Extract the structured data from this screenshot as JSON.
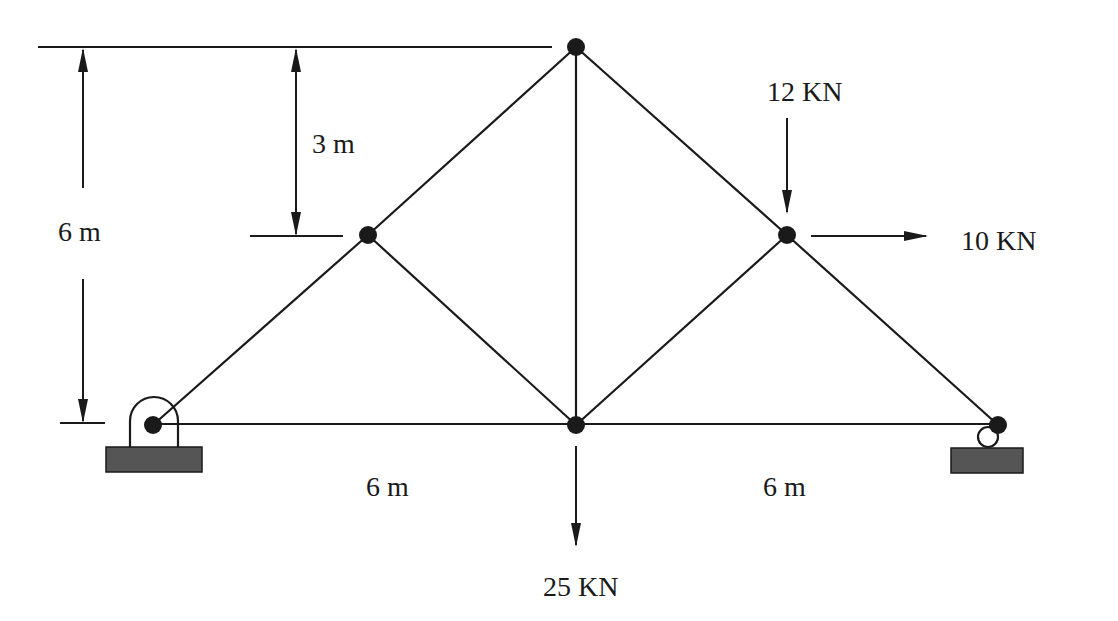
{
  "diagram": {
    "nodes": [
      {
        "id": "A",
        "role": "pin-support",
        "x": 153,
        "y": 425
      },
      {
        "id": "B",
        "role": "joint",
        "x": 368,
        "y": 235
      },
      {
        "id": "C",
        "role": "apex",
        "x": 576,
        "y": 47
      },
      {
        "id": "D",
        "role": "bottom-mid",
        "x": 576,
        "y": 425
      },
      {
        "id": "E",
        "role": "joint",
        "x": 787,
        "y": 235
      },
      {
        "id": "F",
        "role": "roller-support",
        "x": 998,
        "y": 425
      }
    ],
    "members": [
      [
        "A",
        "B"
      ],
      [
        "B",
        "C"
      ],
      [
        "C",
        "E"
      ],
      [
        "E",
        "F"
      ],
      [
        "A",
        "D"
      ],
      [
        "D",
        "F"
      ],
      [
        "B",
        "D"
      ],
      [
        "C",
        "D"
      ],
      [
        "D",
        "E"
      ]
    ],
    "dimensions": {
      "total_height": "6 m",
      "upper_height": "3 m",
      "left_span": "6 m",
      "right_span": "6 m"
    },
    "loads": [
      {
        "label": "12 KN",
        "node": "E",
        "direction": "down"
      },
      {
        "label": "10 KN",
        "node": "E",
        "direction": "right"
      },
      {
        "label": "25 KN",
        "node": "D",
        "direction": "down"
      }
    ],
    "colors": {
      "line": "#1a1a1a",
      "support_base": "#555555",
      "background": "#ffffff"
    }
  }
}
